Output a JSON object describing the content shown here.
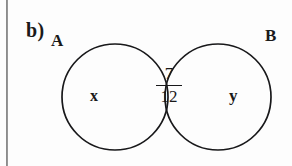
{
  "figure": {
    "type": "venn-diagram",
    "item_label": "b)",
    "background_color": "#fdfdfd",
    "stroke_color": "#18181a",
    "sets": [
      {
        "id": "A",
        "label": "A",
        "region_value": "x"
      },
      {
        "id": "B",
        "label": "B",
        "region_value": "y"
      }
    ],
    "intersection": {
      "value": "7/12",
      "numerator": "7",
      "denominator": "12"
    }
  },
  "geometry": {
    "circle_a": {
      "cx": 115,
      "cy": 97,
      "r": 53
    },
    "circle_b": {
      "cx": 218,
      "cy": 97,
      "r": 53
    }
  }
}
